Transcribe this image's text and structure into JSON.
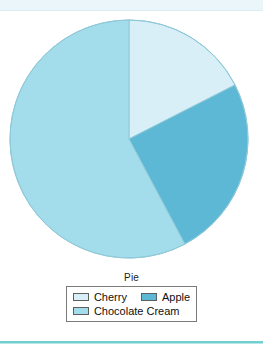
{
  "chart_data": {
    "type": "pie",
    "title": "Pie",
    "xlabel": "",
    "ylabel": "",
    "legend_position": "bottom",
    "grid": false,
    "start_angle_deg": 0,
    "direction": "clockwise",
    "categories": [
      "Cherry",
      "Apple",
      "Chocolate Cream"
    ],
    "values": [
      17.5,
      25,
      57.5
    ],
    "units": "percent",
    "colors": [
      "#d8eff7",
      "#5cb8d4",
      "#a3dcea"
    ],
    "slices": [
      {
        "label": "Cherry",
        "value": 17.5,
        "color": "#d8eff7",
        "start_angle_deg": 0,
        "end_angle_deg": 63
      },
      {
        "label": "Apple",
        "value": 25,
        "color": "#5cb8d4",
        "start_angle_deg": 63,
        "end_angle_deg": 152
      },
      {
        "label": "Chocolate Cream",
        "value": 57.5,
        "color": "#a3dcea",
        "start_angle_deg": 152,
        "end_angle_deg": 360
      }
    ]
  },
  "legend": {
    "title": "Pie",
    "rows": [
      [
        {
          "label": "Cherry",
          "color": "#d8eff7"
        },
        {
          "label": "Apple",
          "color": "#5cb8d4"
        }
      ],
      [
        {
          "label": "Chocolate Cream",
          "color": "#a3dcea"
        }
      ]
    ]
  },
  "decoration": {
    "top_band_color": "#eaf6fa",
    "bottom_rule_color": "#6fcfd1",
    "outline_color": "#7b7b7b",
    "background": "#ffffff"
  }
}
